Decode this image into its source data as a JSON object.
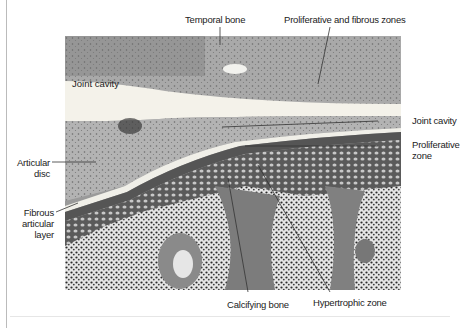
{
  "figure": {
    "type": "histology micrograph with leader-line labels"
  },
  "labels": {
    "temporal_bone": "Temporal bone",
    "proliferative_fibrous": "Proliferative and fibrous zones",
    "joint_cavity_inner": "Joint cavity",
    "joint_cavity_right": "Joint cavity",
    "proliferative_zone_1": "Proliferative",
    "proliferative_zone_2": "zone",
    "articular_disc_1": "Articular",
    "articular_disc_2": "disc",
    "fibrous_layer_1": "Fibrous",
    "fibrous_layer_2": "articular",
    "fibrous_layer_3": "layer",
    "calcifying_bone": "Calcifying bone",
    "hypertrophic_zone": "Hypertrophic zone"
  },
  "colors": {
    "text": "#222222",
    "leader_line": "#333333",
    "background": "#ffffff"
  }
}
